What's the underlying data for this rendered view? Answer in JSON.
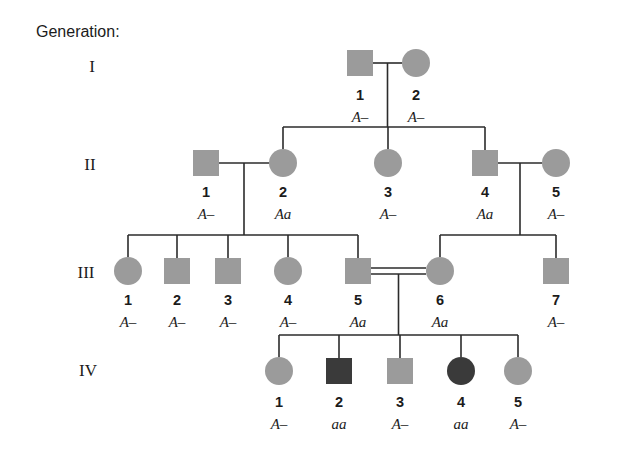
{
  "figure": {
    "kind": "pedigree-chart",
    "generation_header": "Generation:",
    "colors": {
      "unaffected_fill": "#9b9b9b",
      "affected_fill": "#3a3a3a",
      "line": "#2b2b2b",
      "background": "#ffffff",
      "text": "#1b1b1b"
    }
  },
  "generations": [
    {
      "roman": "I",
      "label_x": 92,
      "label_y": 72,
      "symbol_cy": 63,
      "num_y": 100,
      "geno_y": 122,
      "individuals": [
        {
          "id": "I-1",
          "number": "1",
          "shape": "square",
          "sex": "male",
          "affected": false,
          "genotype": "A–",
          "cx": 360
        },
        {
          "id": "I-2",
          "number": "2",
          "shape": "circle",
          "sex": "female",
          "affected": false,
          "genotype": "A–",
          "cx": 416
        }
      ]
    },
    {
      "roman": "II",
      "label_x": 90,
      "label_y": 170,
      "symbol_cy": 163,
      "num_y": 197,
      "geno_y": 219,
      "individuals": [
        {
          "id": "II-1",
          "number": "1",
          "shape": "square",
          "sex": "male",
          "affected": false,
          "genotype": "A–",
          "cx": 206
        },
        {
          "id": "II-2",
          "number": "2",
          "shape": "circle",
          "sex": "female",
          "affected": false,
          "genotype": "Aa",
          "cx": 283
        },
        {
          "id": "II-3",
          "number": "3",
          "shape": "circle",
          "sex": "female",
          "affected": false,
          "genotype": "A–",
          "cx": 388
        },
        {
          "id": "II-4",
          "number": "4",
          "shape": "square",
          "sex": "male",
          "affected": false,
          "genotype": "Aa",
          "cx": 485
        },
        {
          "id": "II-5",
          "number": "5",
          "shape": "circle",
          "sex": "female",
          "affected": false,
          "genotype": "A–",
          "cx": 556
        }
      ]
    },
    {
      "roman": "III",
      "label_x": 86,
      "label_y": 278,
      "symbol_cy": 271,
      "num_y": 305,
      "geno_y": 327,
      "individuals": [
        {
          "id": "III-1",
          "number": "1",
          "shape": "circle",
          "sex": "female",
          "affected": false,
          "genotype": "A–",
          "cx": 128
        },
        {
          "id": "III-2",
          "number": "2",
          "shape": "square",
          "sex": "male",
          "affected": false,
          "genotype": "A–",
          "cx": 177
        },
        {
          "id": "III-3",
          "number": "3",
          "shape": "square",
          "sex": "male",
          "affected": false,
          "genotype": "A–",
          "cx": 228
        },
        {
          "id": "III-4",
          "number": "4",
          "shape": "circle",
          "sex": "female",
          "affected": false,
          "genotype": "A–",
          "cx": 288
        },
        {
          "id": "III-5",
          "number": "5",
          "shape": "square",
          "sex": "male",
          "affected": false,
          "genotype": "Aa",
          "cx": 358
        },
        {
          "id": "III-6",
          "number": "6",
          "shape": "circle",
          "sex": "female",
          "affected": false,
          "genotype": "Aa",
          "cx": 440
        },
        {
          "id": "III-7",
          "number": "7",
          "shape": "square",
          "sex": "male",
          "affected": false,
          "genotype": "A–",
          "cx": 556
        }
      ]
    },
    {
      "roman": "IV",
      "label_x": 88,
      "label_y": 376,
      "symbol_cy": 371,
      "num_y": 407,
      "geno_y": 429,
      "individuals": [
        {
          "id": "IV-1",
          "number": "1",
          "shape": "circle",
          "sex": "female",
          "affected": false,
          "genotype": "A–",
          "cx": 279
        },
        {
          "id": "IV-2",
          "number": "2",
          "shape": "square",
          "sex": "male",
          "affected": true,
          "genotype": "aa",
          "cx": 339
        },
        {
          "id": "IV-3",
          "number": "3",
          "shape": "square",
          "sex": "male",
          "affected": false,
          "genotype": "A–",
          "cx": 400
        },
        {
          "id": "IV-4",
          "number": "4",
          "shape": "circle",
          "sex": "female",
          "affected": true,
          "genotype": "aa",
          "cx": 461
        },
        {
          "id": "IV-5",
          "number": "5",
          "shape": "circle",
          "sex": "female",
          "affected": false,
          "genotype": "A–",
          "cx": 518
        }
      ]
    }
  ],
  "matings": [
    {
      "id": "mating-I1-I2",
      "partners": [
        "I-1",
        "I-2"
      ],
      "consanguineous": false,
      "children": [
        "II-2",
        "II-3",
        "II-4"
      ]
    },
    {
      "id": "mating-II1-II2",
      "partners": [
        "II-1",
        "II-2"
      ],
      "consanguineous": false,
      "children": [
        "III-1",
        "III-2",
        "III-3",
        "III-4",
        "III-5"
      ]
    },
    {
      "id": "mating-II4-II5",
      "partners": [
        "II-4",
        "II-5"
      ],
      "consanguineous": false,
      "children": [
        "III-6",
        "III-7"
      ]
    },
    {
      "id": "mating-III5-III6",
      "partners": [
        "III-5",
        "III-6"
      ],
      "consanguineous": true,
      "children": [
        "IV-1",
        "IV-2",
        "IV-3",
        "IV-4",
        "IV-5"
      ]
    }
  ]
}
